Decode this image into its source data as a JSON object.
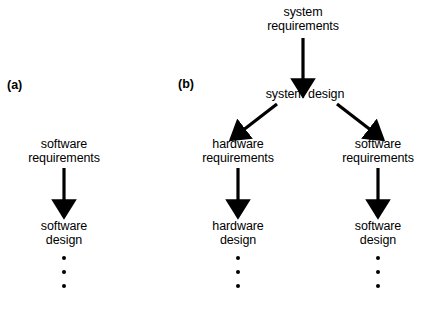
{
  "diagram": {
    "background_color": "#ffffff",
    "ink_color": "#000000",
    "panels": [
      {
        "id": "a",
        "label": "(a)",
        "label_x": 7,
        "label_y": 78,
        "nodes": [
          {
            "id": "a-software-requirements",
            "name": "software-requirements-node",
            "text": "software\nrequirements",
            "x": 64,
            "y": 138
          },
          {
            "id": "a-software-design",
            "name": "software-design-node",
            "text": "software\ndesign",
            "x": 64,
            "y": 220
          }
        ],
        "arrows": [
          {
            "id": "a-arrow-1",
            "name": "arrow-requirements-to-design",
            "x1": 64,
            "y1": 168,
            "x2": 64,
            "y2": 207
          }
        ],
        "ellipsis": [
          {
            "id": "a-dots",
            "name": "continuation-dots",
            "x": 64,
            "y": 256,
            "count": 3
          }
        ]
      },
      {
        "id": "b",
        "label": "(b)",
        "label_x": 178,
        "label_y": 77,
        "nodes": [
          {
            "id": "b-system-requirements",
            "name": "system-requirements-node",
            "text": "system\nrequirements",
            "x": 303,
            "y": 6
          },
          {
            "id": "b-system-design",
            "name": "system-design-node",
            "text": "system design",
            "x": 305,
            "y": 88
          },
          {
            "id": "b-hardware-requirements",
            "name": "hardware-requirements-node",
            "text": "hardware\nrequirements",
            "x": 238,
            "y": 138
          },
          {
            "id": "b-software-requirements",
            "name": "software-requirements-node",
            "text": "software\nrequirements",
            "x": 378,
            "y": 138
          },
          {
            "id": "b-hardware-design",
            "name": "hardware-design-node",
            "text": "hardware\ndesign",
            "x": 238,
            "y": 220
          },
          {
            "id": "b-software-design",
            "name": "software-design-node",
            "text": "software\ndesign",
            "x": 378,
            "y": 220
          }
        ],
        "arrows": [
          {
            "id": "b-arrow-sysreq-sysdes",
            "name": "arrow-system-requirements-to-system-design",
            "x1": 303,
            "y1": 38,
            "x2": 303,
            "y2": 86
          },
          {
            "id": "b-arrow-sysdes-hwreq",
            "name": "arrow-system-design-to-hardware-requirements",
            "x1": 277,
            "y1": 104,
            "x2": 239,
            "y2": 134
          },
          {
            "id": "b-arrow-sysdes-swreq",
            "name": "arrow-system-design-to-software-requirements",
            "x1": 337,
            "y1": 104,
            "x2": 375,
            "y2": 134
          },
          {
            "id": "b-arrow-hwreq-hwdes",
            "name": "arrow-hardware-requirements-to-hardware-design",
            "x1": 238,
            "y1": 168,
            "x2": 238,
            "y2": 207
          },
          {
            "id": "b-arrow-swreq-swdes",
            "name": "arrow-software-requirements-to-software-design",
            "x1": 378,
            "y1": 168,
            "x2": 378,
            "y2": 207
          }
        ],
        "ellipsis": [
          {
            "id": "b-dots-hw",
            "name": "continuation-dots",
            "x": 238,
            "y": 256,
            "count": 3
          },
          {
            "id": "b-dots-sw",
            "name": "continuation-dots",
            "x": 378,
            "y": 256,
            "count": 3
          }
        ]
      }
    ]
  }
}
